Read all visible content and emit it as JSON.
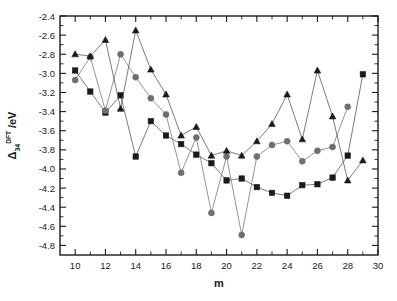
{
  "chart_data": {
    "type": "line",
    "title": "",
    "xlabel": "m",
    "ylabel_base": "Δ",
    "ylabel_sub": "34",
    "ylabel_sup": "DFT",
    "ylabel_unit": "/eV",
    "ylabel_full": "Δ34DFT /eV",
    "xlim": [
      9,
      30
    ],
    "ylim": [
      -4.9,
      -2.4
    ],
    "grid": false,
    "legend": "none",
    "x_tick_labels": [
      "10",
      "12",
      "14",
      "16",
      "18",
      "20",
      "22",
      "24",
      "26",
      "28",
      "30"
    ],
    "x_tick_values": [
      10,
      12,
      14,
      16,
      18,
      20,
      22,
      24,
      26,
      28,
      30
    ],
    "x_minor_tick_values": [
      11,
      13,
      15,
      17,
      19,
      21,
      23,
      25,
      27,
      29
    ],
    "y_tick_labels": [
      "-2.4",
      "-2.6",
      "-2.8",
      "-3.0",
      "-3.2",
      "-3.4",
      "-3.6",
      "-3.8",
      "-4.0",
      "-4.2",
      "-4.4",
      "-4.6",
      "-4.8"
    ],
    "y_tick_values": [
      -2.4,
      -2.6,
      -2.8,
      -3.0,
      -3.2,
      -3.4,
      -3.6,
      -3.8,
      -4.0,
      -4.2,
      -4.4,
      -4.6,
      -4.8
    ],
    "x": [
      10,
      11,
      12,
      13,
      14,
      15,
      16,
      17,
      18,
      19,
      20,
      21,
      22,
      23,
      24,
      25,
      26,
      27,
      28,
      29
    ],
    "series": [
      {
        "name": "square-series",
        "marker": "square",
        "color": "#1a1a1a",
        "line_color": "#5a5a5a",
        "values": [
          -2.97,
          -3.19,
          -3.41,
          -3.23,
          -3.87,
          -3.5,
          -3.65,
          -3.74,
          -3.85,
          -3.94,
          -4.12,
          -4.1,
          -4.19,
          -4.25,
          -4.28,
          -4.17,
          -4.16,
          -4.09,
          -3.86,
          -3.01
        ]
      },
      {
        "name": "circle-series",
        "marker": "circle",
        "color": "#6e6e6e",
        "line_color": "#7a7a7a",
        "values": [
          -3.07,
          -2.83,
          -3.39,
          -2.8,
          -3.04,
          -3.26,
          -3.43,
          -4.04,
          -3.67,
          -4.46,
          -3.87,
          -4.69,
          -3.87,
          -3.75,
          -3.71,
          -3.92,
          -3.81,
          -3.77,
          -3.35,
          null
        ]
      },
      {
        "name": "triangle-series",
        "marker": "triangle",
        "color": "#1a1a1a",
        "line_color": "#5a5a5a",
        "values": [
          -2.8,
          -2.82,
          -2.65,
          -3.37,
          -2.55,
          -2.96,
          -3.22,
          -3.65,
          -3.56,
          -3.86,
          -3.81,
          -3.86,
          -3.71,
          -3.53,
          -3.22,
          -3.69,
          -2.97,
          -3.45,
          -4.12,
          -3.91
        ]
      }
    ]
  }
}
